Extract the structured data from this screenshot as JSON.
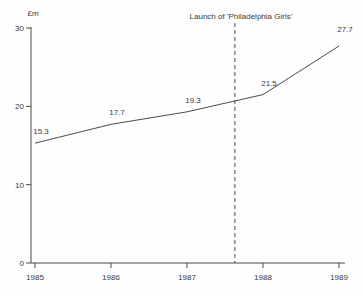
{
  "chart_data": {
    "type": "line",
    "title": "",
    "xlabel": "",
    "ylabel": "£m",
    "x": [
      1985,
      1986,
      1987,
      1988,
      1989
    ],
    "values": [
      15.3,
      17.7,
      19.3,
      21.5,
      27.7
    ],
    "point_labels": [
      "15.3",
      "17.7",
      "19.3",
      "21.5",
      "27.7"
    ],
    "xticks": [
      "1985",
      "1986",
      "1987",
      "1988",
      "1989"
    ],
    "yticks": [
      0,
      10,
      20,
      30
    ],
    "xlim": [
      1985,
      1989
    ],
    "ylim": [
      0,
      30
    ],
    "grid": false,
    "legend": "none",
    "annotation": {
      "text": "Launch of 'Philadelphia Girls'",
      "x": 1987.63,
      "marker": "dashed-vertical-line"
    },
    "colors": {
      "line": "#4a4a4a",
      "axis": "#4a4a4a",
      "text": "#3a3a3a",
      "background": "#fefefe"
    }
  }
}
